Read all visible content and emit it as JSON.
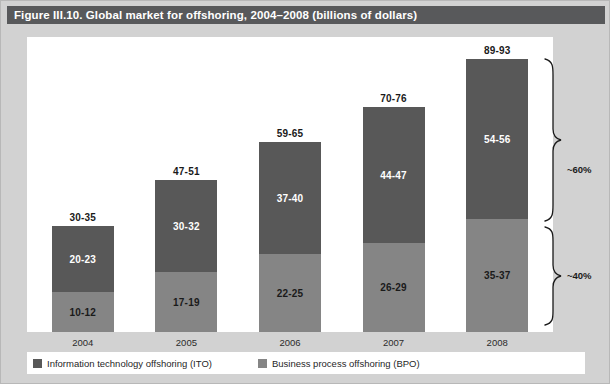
{
  "figure": {
    "title": "Figure III.10. Global market for offshoring, 2004–2008 (billions of dollars)"
  },
  "legend": {
    "items": [
      {
        "label": "Information technology offshoring (ITO)",
        "key": "ito",
        "color": "#585858"
      },
      {
        "label": "Business process offshoring (BPO)",
        "key": "bpo",
        "color": "#858585"
      }
    ]
  },
  "annotations": [
    {
      "name": "share-ito",
      "label": "~60%"
    },
    {
      "name": "share-bpo",
      "label": "~40%"
    }
  ],
  "chart_data": {
    "type": "bar",
    "subtype": "stacked",
    "title": "Figure III.10. Global market for offshoring, 2004–2008 (billions of dollars)",
    "xlabel": "",
    "ylabel": "Billions of dollars",
    "ylim": [
      0,
      100
    ],
    "grid": false,
    "legend_position": "bottom",
    "categories": [
      "2004",
      "2005",
      "2006",
      "2007",
      "2008"
    ],
    "series": [
      {
        "name": "Business process offshoring (BPO)",
        "color": "#858585",
        "labels": [
          "10-12",
          "17-19",
          "22-25",
          "26-29",
          "35-37"
        ],
        "values": [
          11,
          18,
          23.5,
          27.5,
          36
        ]
      },
      {
        "name": "Information technology offshoring (ITO)",
        "color": "#585858",
        "labels": [
          "20-23",
          "30-32",
          "37-40",
          "44-47",
          "54-56"
        ],
        "values": [
          21.5,
          31,
          38.5,
          45.5,
          55
        ]
      }
    ],
    "totals": {
      "labels": [
        "30-35",
        "47-51",
        "59-65",
        "70-76",
        "89-93"
      ],
      "values": [
        32.5,
        49,
        62,
        73,
        91
      ]
    },
    "annotations": [
      "~60%",
      "~40%"
    ]
  },
  "bars": [
    {
      "year": "2004",
      "total_label": "30-35",
      "ito_label": "20-23",
      "bpo_label": "10-12",
      "total_px": 106,
      "ito_px": 66,
      "bpo_px": 40
    },
    {
      "year": "2005",
      "total_label": "47-51",
      "ito_label": "30-32",
      "bpo_label": "17-19",
      "total_px": 152,
      "ito_px": 92,
      "bpo_px": 60
    },
    {
      "year": "2006",
      "total_label": "59-65",
      "ito_label": "37-40",
      "bpo_label": "22-25",
      "total_px": 190,
      "ito_px": 112,
      "bpo_px": 78
    },
    {
      "year": "2007",
      "total_label": "70-76",
      "ito_label": "44-47",
      "bpo_label": "26-29",
      "total_px": 225,
      "ito_px": 136,
      "bpo_px": 89
    },
    {
      "year": "2008",
      "total_label": "89-93",
      "ito_label": "54-56",
      "bpo_label": "35-37",
      "total_px": 273,
      "ito_px": 160,
      "bpo_px": 113
    }
  ]
}
